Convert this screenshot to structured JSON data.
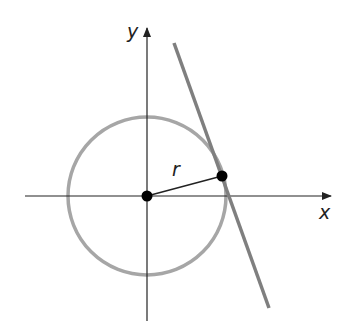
{
  "diagram": {
    "axes": {
      "x_label": "x",
      "y_label": "y"
    },
    "radius_label": "r",
    "colors": {
      "axes": "#222222",
      "circle": "#a6a6a6",
      "tangent_line": "#7f7f7f",
      "points": "#000000",
      "radius_segment": "#222222"
    },
    "points": [
      {
        "name": "origin"
      },
      {
        "name": "point-of-tangency"
      }
    ]
  }
}
